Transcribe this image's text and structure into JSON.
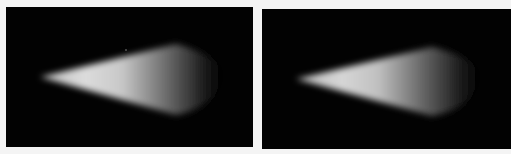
{
  "figure": {
    "panels": [
      {
        "id": "left",
        "description": "Cone-shaped light beam on black background, bright near tip, fading to the right",
        "background": "#020202",
        "beam_color": "#e8e8e8"
      },
      {
        "id": "right",
        "description": "Cone-shaped light beam on black background, slightly dimmer, fading to the right",
        "background": "#020202",
        "beam_color": "#dedede"
      }
    ],
    "page_background": "#f4f4f4"
  }
}
